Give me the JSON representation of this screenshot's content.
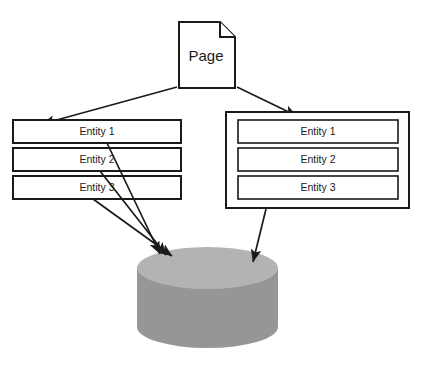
{
  "diagram": {
    "type": "data-flow-diagram",
    "background_color": "#ffffff",
    "line_color": "#1a1a1a",
    "source": {
      "label": "Page",
      "shape": "document-with-folded-corner"
    },
    "left_group": {
      "group_label": "",
      "has_container": false,
      "items": [
        {
          "label": "Entity 1"
        },
        {
          "label": "Entity 2"
        },
        {
          "label": "Entity 3"
        }
      ],
      "arrows_to_database": 3
    },
    "right_group": {
      "group_label": "",
      "has_container": true,
      "items": [
        {
          "label": "Entity 1"
        },
        {
          "label": "Entity 2"
        },
        {
          "label": "Entity 3"
        }
      ],
      "arrows_to_database": 1
    },
    "database": {
      "label": "",
      "shape": "cylinder",
      "top_color": "#b3b3b3",
      "body_color": "#969696"
    },
    "connections": [
      {
        "from": "Page",
        "to": "left_group"
      },
      {
        "from": "Page",
        "to": "right_group"
      },
      {
        "from": "Entity 1 (left)",
        "to": "database"
      },
      {
        "from": "Entity 2 (left)",
        "to": "database"
      },
      {
        "from": "Entity 3 (left)",
        "to": "database"
      },
      {
        "from": "right_group container",
        "to": "database"
      }
    ]
  }
}
